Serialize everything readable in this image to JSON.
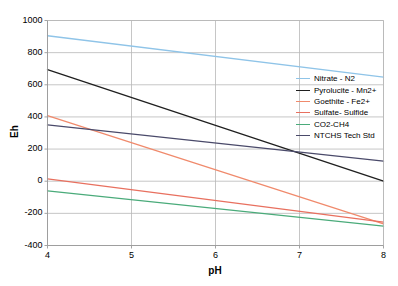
{
  "chart_data": {
    "type": "line",
    "title": "",
    "xlabel": "pH",
    "ylabel": "Eh",
    "xlim": [
      4,
      8
    ],
    "ylim": [
      -400,
      1000
    ],
    "xticks": [
      4,
      5,
      6,
      7,
      8
    ],
    "yticks": [
      -400,
      -200,
      0,
      200,
      400,
      600,
      800,
      1000
    ],
    "grid": true,
    "legend_position": "right",
    "x": [
      4,
      8
    ],
    "series": [
      {
        "name": "Nitrate - N2",
        "color": "#8fc4e8",
        "values": [
          905,
          648
        ]
      },
      {
        "name": "Pyrolucite - Mn2+",
        "color": "#1f1f1f",
        "values": [
          695,
          0
        ]
      },
      {
        "name": "Goethite - Fe2+",
        "color": "#f08a6c",
        "values": [
          408,
          -265
        ]
      },
      {
        "name": "Sulfate- Sulfide",
        "color": "#e8705f",
        "values": [
          15,
          -255
        ]
      },
      {
        "name": "CO2-CH4",
        "color": "#4aab7a",
        "values": [
          -60,
          -280
        ]
      },
      {
        "name": "NTCHS Tech Std",
        "color": "#4a4a6a",
        "values": [
          350,
          125
        ]
      }
    ]
  },
  "axis": {
    "y_tick_labels": [
      "1000",
      "800",
      "600",
      "400",
      "200",
      "0",
      "-200",
      "-400"
    ],
    "x_tick_labels": [
      "4",
      "5",
      "6",
      "7",
      "8"
    ],
    "y_title": "Eh",
    "x_title": "pH"
  },
  "legend": {
    "items": [
      {
        "label": "Nitrate - N2",
        "color": "#8fc4e8"
      },
      {
        "label": "Pyrolucite - Mn2+",
        "color": "#1f1f1f"
      },
      {
        "label": "Goethite - Fe2+",
        "color": "#f08a6c"
      },
      {
        "label": "Sulfate- Sulfide",
        "color": "#e8705f"
      },
      {
        "label": "CO2-CH4",
        "color": "#4aab7a"
      },
      {
        "label": "NTCHS Tech Std",
        "color": "#4a4a6a"
      }
    ]
  },
  "style": {
    "grid_color": "#b8b8b8",
    "axis_color": "#9a9a9a",
    "background": "#ffffff"
  }
}
